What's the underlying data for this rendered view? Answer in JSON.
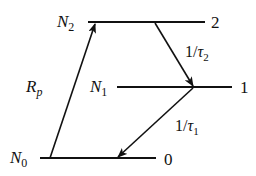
{
  "diagram": {
    "type": "energy-level-diagram",
    "colors": {
      "ink": "#111111",
      "background": "#ffffff"
    },
    "levels": [
      {
        "id": "level-2",
        "population_label": "N",
        "population_sub": "2",
        "index_label": "2"
      },
      {
        "id": "level-1",
        "population_label": "N",
        "population_sub": "1",
        "index_label": "1"
      },
      {
        "id": "level-0",
        "population_label": "N",
        "population_sub": "0",
        "index_label": "0"
      }
    ],
    "transitions": [
      {
        "id": "pump",
        "from": "0",
        "to": "2",
        "label": "R",
        "label_sub": "p"
      },
      {
        "id": "decay-2-1",
        "from": "2",
        "to": "1",
        "label_prefix": "1/",
        "label": "τ",
        "label_sub": "2"
      },
      {
        "id": "decay-1-0",
        "from": "1",
        "to": "0",
        "label_prefix": "1/",
        "label": "τ",
        "label_sub": "1"
      }
    ]
  }
}
